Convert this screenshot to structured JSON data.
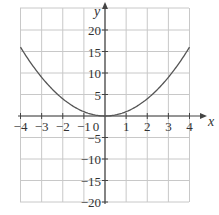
{
  "chart_data": {
    "type": "line",
    "title": "",
    "xlabel": "x",
    "ylabel": "y",
    "xlim": [
      -4,
      4
    ],
    "ylim": [
      -20,
      20
    ],
    "grid": true,
    "x_ticks": [
      "-4",
      "-3",
      "-2",
      "-1",
      "0",
      "1",
      "2",
      "3",
      "4"
    ],
    "y_ticks": [
      "20",
      "15",
      "10",
      "5",
      "-5",
      "-10",
      "-15",
      "-20"
    ],
    "series": [
      {
        "name": "y = x^2",
        "x": [
          -4,
          -3,
          -2,
          -1,
          0,
          1,
          2,
          3,
          4
        ],
        "values": [
          16,
          9,
          4,
          1,
          0,
          1,
          4,
          9,
          16
        ]
      }
    ]
  },
  "colors": {
    "grid": "#c8c8c8",
    "axis": "#444444",
    "curve": "#555555"
  }
}
